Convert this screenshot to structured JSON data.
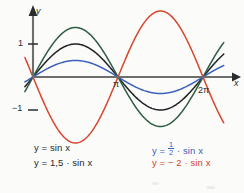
{
  "figure": {
    "axes": {
      "x_axis_label": "x",
      "y_axis_label": "y",
      "x_ticks": [
        "π",
        "2π"
      ],
      "y_ticks": [
        "1",
        "−1"
      ]
    },
    "legend_left": [
      {
        "text": "y = sin x",
        "color": "#25282b"
      },
      {
        "text": "y = 1,5 · sin x",
        "color": "#25282b"
      }
    ],
    "legend_right": [
      {
        "prefix": "y = ",
        "num": "1",
        "den": "2",
        "suffix": " · sin x",
        "color": "#3a5fbe"
      },
      {
        "text": "y = − 2 · sin x",
        "color": "#d8452c"
      }
    ]
  },
  "chart_data": {
    "type": "line",
    "title": "",
    "xlabel": "x",
    "ylabel": "y",
    "xlim": [
      -0.35,
      7.2
    ],
    "ylim": [
      -2.35,
      2.35
    ],
    "grid": false,
    "legend_position": "below-plot",
    "x_tick_values": [
      3.14159,
      6.28319
    ],
    "x_tick_labels": [
      "π",
      "2π"
    ],
    "y_tick_values": [
      1,
      -1
    ],
    "y_tick_labels": [
      "1",
      "−1"
    ],
    "series": [
      {
        "name": "y = sin x",
        "amplitude": 1,
        "color": "#1d2124",
        "formula": "sin(x)",
        "x": [
          0,
          0.7854,
          1.5708,
          2.3562,
          3.14159,
          3.927,
          4.7124,
          5.4978,
          6.28319
        ],
        "values": [
          0,
          0.707,
          1,
          0.707,
          0,
          -0.707,
          -1,
          -0.707,
          0
        ]
      },
      {
        "name": "y = 1,5 · sin x",
        "amplitude": 1.5,
        "color": "#2d5b43",
        "formula": "1.5*sin(x)",
        "x": [
          0,
          0.7854,
          1.5708,
          2.3562,
          3.14159,
          3.927,
          4.7124,
          5.4978,
          6.28319
        ],
        "values": [
          0,
          1.061,
          1.5,
          1.061,
          0,
          -1.061,
          -1.5,
          -1.061,
          0
        ]
      },
      {
        "name": "y = 1/2 · sin x",
        "amplitude": 0.5,
        "color": "#3a5fbe",
        "formula": "0.5*sin(x)",
        "x": [
          0,
          0.7854,
          1.5708,
          2.3562,
          3.14159,
          3.927,
          4.7124,
          5.4978,
          6.28319
        ],
        "values": [
          0,
          0.354,
          0.5,
          0.354,
          0,
          -0.354,
          -0.5,
          -0.354,
          0
        ]
      },
      {
        "name": "y = − 2 · sin x",
        "amplitude": -2,
        "color": "#d8452c",
        "formula": "-2*sin(x)",
        "x": [
          0,
          0.7854,
          1.5708,
          2.3562,
          3.14159,
          3.927,
          4.7124,
          5.4978,
          6.28319
        ],
        "values": [
          0,
          -1.414,
          -2,
          -1.414,
          0,
          1.414,
          2,
          1.414,
          0
        ]
      }
    ]
  }
}
